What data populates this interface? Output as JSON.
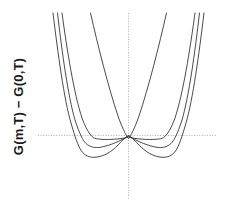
{
  "figure": {
    "background_color": "#ffffff",
    "axis_color": "#b0b0b0",
    "curve_color": "#2b2b2b"
  },
  "axes": {
    "ylabel": "G(m,T) − G(0,T)",
    "xlabel": "",
    "title": "",
    "xticklabels": [],
    "yticklabels": [],
    "grid": false,
    "legend": "none",
    "zero_lines": {
      "horizontal": true,
      "vertical": true,
      "style": "dotted"
    }
  },
  "chart_data": {
    "type": "line",
    "title": "",
    "xlabel": "",
    "ylabel": "G(m,T) − G(0,T)",
    "xlim": [
      -1.0,
      1.0
    ],
    "ylim": [
      -0.28,
      1.0
    ],
    "grid": false,
    "legend_position": "none",
    "annotations": [],
    "x": [
      -1.0,
      -0.95,
      -0.9,
      -0.85,
      -0.8,
      -0.75,
      -0.7,
      -0.65,
      -0.6,
      -0.55,
      -0.5,
      -0.45,
      -0.4,
      -0.35,
      -0.3,
      -0.25,
      -0.2,
      -0.15,
      -0.1,
      -0.05,
      0.0,
      0.05,
      0.1,
      0.15,
      0.2,
      0.25,
      0.3,
      0.35,
      0.4,
      0.45,
      0.5,
      0.55,
      0.6,
      0.65,
      0.7,
      0.75,
      0.8,
      0.85,
      0.9,
      0.95,
      1.0
    ],
    "series": [
      {
        "name": "T > Tc",
        "a": 0.55,
        "b": 0.45,
        "minimum_positions": [
          0.0
        ],
        "minimum_value": 0.0,
        "values": [
          1.0,
          0.862,
          0.741,
          0.632,
          0.536,
          0.452,
          0.378,
          0.313,
          0.256,
          0.208,
          0.166,
          0.13,
          0.1,
          0.075,
          0.054,
          0.037,
          0.023,
          0.013,
          0.006,
          0.001,
          0.0,
          0.001,
          0.006,
          0.013,
          0.023,
          0.037,
          0.054,
          0.075,
          0.1,
          0.13,
          0.166,
          0.208,
          0.256,
          0.313,
          0.378,
          0.452,
          0.536,
          0.632,
          0.741,
          0.862,
          1.0
        ]
      },
      {
        "name": "T = Tc",
        "a": 0.0,
        "b": 1.0,
        "minimum_positions": [
          0.0
        ],
        "minimum_value": 0.0,
        "values": [
          1.0,
          0.815,
          0.656,
          0.522,
          0.41,
          0.316,
          0.24,
          0.179,
          0.13,
          0.092,
          0.063,
          0.041,
          0.026,
          0.015,
          0.008,
          0.004,
          0.0016,
          0.0005,
          0.0001,
          0.0,
          0.0,
          0.0,
          0.0001,
          0.0005,
          0.0016,
          0.004,
          0.008,
          0.015,
          0.026,
          0.041,
          0.063,
          0.092,
          0.13,
          0.179,
          0.24,
          0.316,
          0.41,
          0.522,
          0.656,
          0.815,
          1.0
        ]
      },
      {
        "name": "T slightly < Tc",
        "a": -0.22,
        "b": 1.0,
        "minimum_positions": [
          -0.33,
          0.33
        ],
        "minimum_value": -0.012,
        "values": [
          0.78,
          0.616,
          0.478,
          0.363,
          0.269,
          0.192,
          0.132,
          0.086,
          0.051,
          0.026,
          0.01,
          0.0,
          -0.005,
          -0.008,
          -0.0099,
          -0.0101,
          -0.0086,
          -0.0049,
          -0.0021,
          -0.0005,
          0.0,
          -0.0005,
          -0.0021,
          -0.0049,
          -0.0086,
          -0.0101,
          -0.0099,
          -0.008,
          -0.005,
          0.0,
          0.01,
          0.026,
          0.051,
          0.086,
          0.132,
          0.192,
          0.269,
          0.363,
          0.478,
          0.616,
          0.78
        ]
      },
      {
        "name": "T well < Tc",
        "a": -0.46,
        "b": 1.0,
        "minimum_positions": [
          -0.48,
          0.48
        ],
        "minimum_value": -0.053,
        "values": [
          0.54,
          0.402,
          0.289,
          0.197,
          0.126,
          0.071,
          0.031,
          0.004,
          -0.014,
          -0.025,
          -0.03,
          -0.032,
          -0.031,
          -0.029,
          -0.025,
          -0.02,
          -0.015,
          -0.0093,
          -0.0044,
          -0.0011,
          0.0,
          -0.0011,
          -0.0044,
          -0.0093,
          -0.015,
          -0.02,
          -0.025,
          -0.029,
          -0.031,
          -0.032,
          -0.03,
          -0.025,
          -0.014,
          0.004,
          0.031,
          0.071,
          0.126,
          0.197,
          0.289,
          0.402,
          0.54
        ]
      }
    ]
  },
  "curves": {
    "paths": [
      {
        "name": "curve-above-tc",
        "d": "M 54.5,13 C 62,46 72,86 82,116 C 88,133 92,138 92.5,138.6 L 92.5,138.6 C 93,138 97,133 103,116 C 113,86 123,46 130.5,13"
      },
      {
        "name": "curve-at-tc",
        "d": "M 26.0,13 C 31,50 38,94 46,118 C 51,132 56,137.2 58.5,138.2 C 63,139.6 72,139.9 82,138.9 C 88,138.3 91.5,137.4 92.5,136.9 C 93.5,137.4 97,138.3 103,138.9 C 113,139.9 122,139.6 126.5,138.2 C 129,137.2 134,132 139,118 C 147,94 154,50 159,13"
      },
      {
        "name": "curve-below-tc-shallow",
        "d": "M 21.5,13 C 26,52 32,96 39,120 C 43.5,134 47,140.5 50,143.5 C 54,147.2 59,148.2 65,147.2 C 73,145.8 82,141.8 88,138.6 C 91,136.9 92.2,136.2 92.5,135.9 C 92.8,136.2 94,136.9 97,138.6 C 103,141.8 112,145.8 120,147.2 C 126,148.2 131,147.2 135,143.5 C 138,140.5 141.5,134 146,120 C 153,96 159,52 163.5,13"
      },
      {
        "name": "curve-below-tc-deep",
        "d": "M 17.0,13 C 22,54 28,99 35,123 C 39,137 42,146 45.5,151 C 49,156 54,157.8 60,157.2 C 68,156.4 76,151.5 82,145 C 87,139.5 91,136.2 92.5,135.6 C 94,136.2 98,139.5 103,145 C 109,151.5 117,156.4 125,157.2 C 131,157.8 136,156 139.5,151 C 143,146 146,137 150,123 C 157,99 163,54 168,13"
      }
    ],
    "hline": {
      "name": "zero-energy-line",
      "x1": 2,
      "x2": 180,
      "y": 135.5
    },
    "vline": {
      "name": "zero-magnetization-line",
      "x": 92.5,
      "y1": 13,
      "y2": 200
    }
  }
}
